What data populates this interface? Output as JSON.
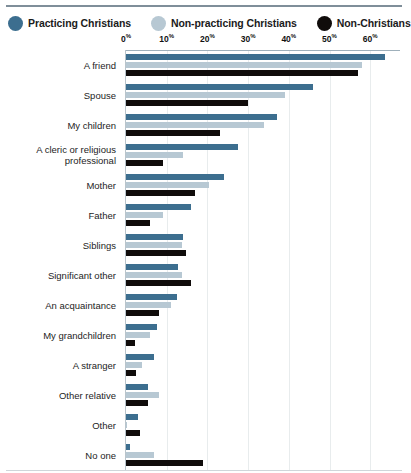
{
  "legend": {
    "items": [
      {
        "label": "Practicing Christians",
        "color": "#3c6e8f",
        "swatch_name": "legend-swatch-practicing-christians"
      },
      {
        "label": "Non-practicing Christians",
        "color": "#b7c8d3",
        "swatch_name": "legend-swatch-non-practicing-christians"
      },
      {
        "label": "Non-Christians",
        "color": "#100c0b",
        "swatch_name": "legend-swatch-non-christians"
      }
    ]
  },
  "axis": {
    "ticks": [
      "0",
      "10",
      "20",
      "30",
      "40",
      "50",
      "60"
    ],
    "suffix": "%",
    "min": 0,
    "max": 63.6
  },
  "chart_data": {
    "type": "bar",
    "orientation": "horizontal",
    "title": "",
    "subtitle": "",
    "xlabel": "",
    "ylabel": "",
    "xlim": [
      0,
      63.6
    ],
    "xticks": [
      0,
      10,
      20,
      30,
      40,
      50,
      60
    ],
    "xtick_labels": [
      "0%",
      "10%",
      "20%",
      "30%",
      "40%",
      "50%",
      "60%"
    ],
    "grid": true,
    "legend_position": "top",
    "categories": [
      "A friend",
      "Spouse",
      "My children",
      "A cleric or religious professional",
      "Mother",
      "Father",
      "Siblings",
      "Significant other",
      "An acquaintance",
      "My grandchildren",
      "A stranger",
      "Other relative",
      "Other",
      "No one"
    ],
    "series": [
      {
        "name": "Practicing Christians",
        "color": "#3c6e8f",
        "values": [
          63.6,
          46,
          37,
          27.5,
          24,
          16,
          14,
          12.8,
          12.5,
          7.6,
          7,
          5.4,
          3,
          1
        ]
      },
      {
        "name": "Non-practicing Christians",
        "color": "#b7c8d3",
        "values": [
          58,
          39,
          34,
          14,
          20.5,
          9,
          13.8,
          13.8,
          11,
          6,
          4,
          8,
          0.3,
          7
        ]
      },
      {
        "name": "Non-Christians",
        "color": "#100c0b",
        "values": [
          57,
          30,
          23,
          9,
          17,
          6,
          14.7,
          16,
          8,
          2.2,
          2.5,
          5.4,
          3.5,
          19
        ]
      }
    ]
  }
}
